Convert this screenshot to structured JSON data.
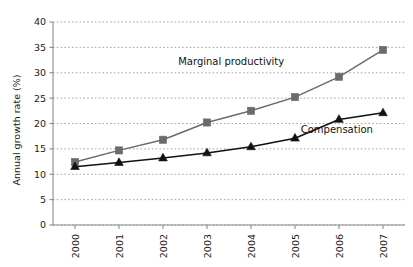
{
  "chart_data": {
    "type": "line",
    "title": "",
    "xlabel": "",
    "ylabel": "Annual growth rate (%)",
    "categories": [
      "2000",
      "2001",
      "2002",
      "2003",
      "2004",
      "2005",
      "2006",
      "2007"
    ],
    "x_tick_labels": [
      "2000",
      "2001",
      "2002",
      "2003",
      "2004",
      "2005",
      "2006",
      "2007"
    ],
    "y_tick_labels": [
      "0",
      "5",
      "10",
      "15",
      "20",
      "25",
      "30",
      "35",
      "40"
    ],
    "y_ticks": [
      0,
      5,
      10,
      15,
      20,
      25,
      30,
      35,
      40
    ],
    "ylim": [
      0,
      40
    ],
    "grid": "horizontal-dotted",
    "legend_position": "inline-annotations",
    "series": [
      {
        "name": "Marginal productivity",
        "marker": "square",
        "color": "#6b6b6b",
        "line_color": "#6b6b6b",
        "values": [
          12.4,
          14.7,
          16.8,
          20.2,
          22.5,
          25.2,
          29.2,
          34.5
        ],
        "annotation": {
          "text": "Marginal productivity",
          "x": 2003.55,
          "y": 31.6,
          "anchor": "middle"
        }
      },
      {
        "name": "Compensation",
        "marker": "triangle",
        "color": "#111111",
        "line_color": "#111111",
        "values": [
          11.5,
          12.3,
          13.2,
          14.2,
          15.4,
          17.1,
          20.8,
          22.1
        ],
        "annotation": {
          "text": "Compensation",
          "x": 2005.95,
          "y": 18.2,
          "anchor": "middle"
        }
      }
    ]
  },
  "axes": {
    "y_axis_title": "Annual growth rate (%)"
  }
}
